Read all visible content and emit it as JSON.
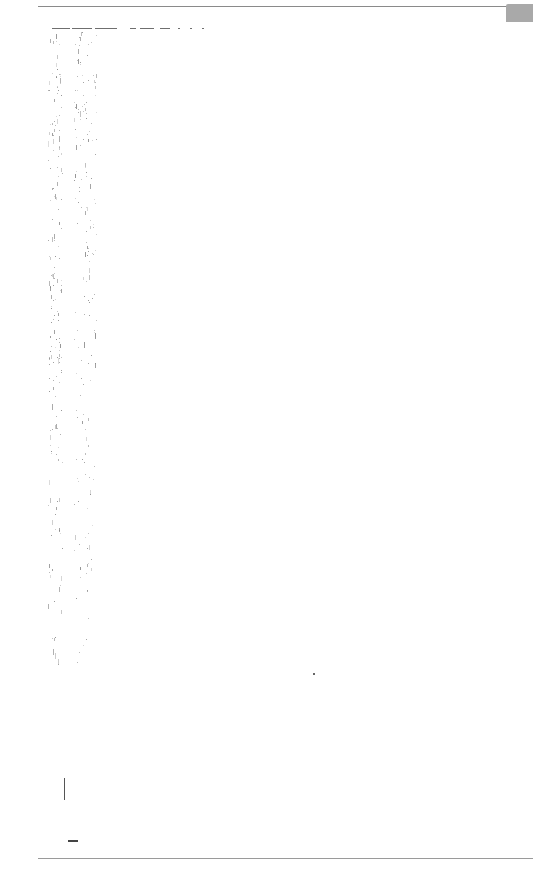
{
  "document": {
    "type": "scanned-page",
    "content_text": "",
    "has_legible_text": false
  },
  "colors": {
    "page_background": "#ffffff",
    "rule_color": "#8a8a8a",
    "corner_tab_color": "#a9a9a9",
    "speckle_color": "#7a7a7a"
  }
}
